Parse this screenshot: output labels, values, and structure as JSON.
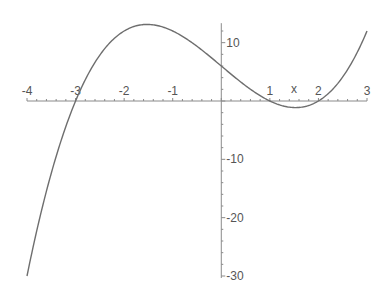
{
  "chart_data": {
    "type": "line",
    "title": "",
    "xlabel": "x",
    "ylabel": "",
    "function": "x^3 - 7x + 6",
    "xlim": [
      -4,
      3
    ],
    "ylim": [
      -30,
      13
    ],
    "x_ticks": [
      -4,
      -3,
      -2,
      -1,
      1,
      2,
      3
    ],
    "y_ticks": [
      10,
      -10,
      -20,
      -30
    ],
    "grid": false,
    "legend": null,
    "series": [
      {
        "name": "f(x)",
        "x": [
          -4,
          -3.5,
          -3,
          -2.5,
          -2,
          -1.5,
          -1,
          -0.5,
          0,
          0.5,
          1,
          1.5,
          2,
          2.5,
          3
        ],
        "y": [
          -30,
          -12.375,
          0,
          8.875,
          12,
          13.125,
          12,
          9.375,
          6,
          2.625,
          0,
          -1.125,
          0,
          3.125,
          12
        ]
      }
    ]
  },
  "colors": {
    "curve": "#6e6e6e",
    "axis": "#8a8a8a",
    "label": "#555555"
  }
}
